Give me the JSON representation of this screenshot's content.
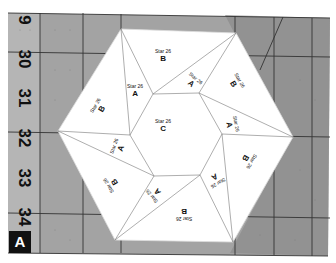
{
  "photo": {
    "description": "Star 26 hexagon quilt block paper-pieced template on a cutting mat",
    "mat_color": "#9e9e9e",
    "mat_dark_color": "#7a7a7a",
    "paper_color": "#ffffff",
    "line_color": "#777777"
  },
  "ruler": {
    "numbers": [
      "9",
      "30",
      "31",
      "32",
      "33",
      "34"
    ]
  },
  "badge": {
    "label": "A"
  },
  "pieces": {
    "center": {
      "star": "Star 26",
      "letter": "C"
    },
    "b_top": {
      "star": "Star 26",
      "letter": "B"
    },
    "b_upper_right": {
      "star": "Star 26",
      "letter": "B"
    },
    "b_lower_right": {
      "star": "Star 26",
      "letter": "B"
    },
    "b_bottom": {
      "star": "Star 26",
      "letter": "B"
    },
    "b_lower_left": {
      "star": "Star 26",
      "letter": "B"
    },
    "b_upper_left": {
      "star": "Star 26",
      "letter": "B"
    },
    "a_top_left": {
      "star": "Star 26",
      "letter": "A"
    },
    "a_top_right": {
      "star": "Star 26",
      "letter": "A"
    },
    "a_right": {
      "star": "Star 26",
      "letter": "A"
    },
    "a_bottom_right": {
      "star": "Star 26",
      "letter": "A"
    },
    "a_bottom_left": {
      "star": "Star 26",
      "letter": "A"
    },
    "a_left": {
      "star": "Star 26",
      "letter": "A"
    }
  }
}
